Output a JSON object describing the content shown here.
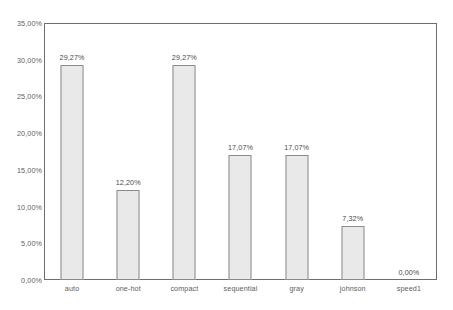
{
  "chart_data": {
    "type": "bar",
    "title": "",
    "xlabel": "",
    "ylabel": "",
    "categories": [
      "auto",
      "one-hot",
      "compact",
      "sequential",
      "gray",
      "johnson",
      "speed1"
    ],
    "values": [
      29.27,
      12.2,
      29.27,
      17.07,
      17.07,
      7.32,
      0.0
    ],
    "value_labels": [
      "29,27%",
      "12,20%",
      "29,27%",
      "17,07%",
      "17,07%",
      "7,32%",
      "0,00%"
    ],
    "ylim": [
      0,
      35
    ],
    "ytick_values": [
      0,
      5,
      10,
      15,
      20,
      25,
      30,
      35
    ],
    "ytick_labels": [
      "0,00%",
      "5,00%",
      "10,00%",
      "15,00%",
      "20,00%",
      "25,00%",
      "30,00%",
      "35,00%"
    ],
    "grid": false,
    "legend": false,
    "decimal_separator": ",",
    "colors": {
      "bar_fill": "#e9e9e9",
      "bar_border": "#8a8a8a",
      "frame": "#6e6e6e",
      "tick_text": "#5d5d5d",
      "value_text": "#4a4a4a",
      "background": "#ffffff"
    }
  }
}
